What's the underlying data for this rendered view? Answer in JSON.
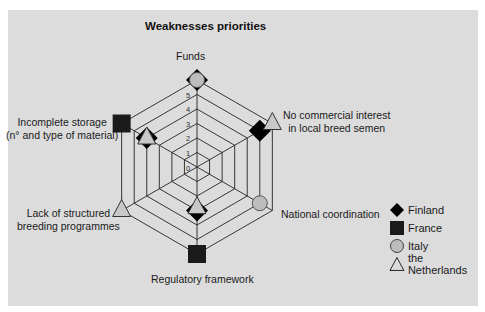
{
  "chart_data": {
    "type": "radar",
    "title": "Weaknesses priorities",
    "axes": [
      "Funds",
      "No commercial interest in local breed semen",
      "National coordination",
      "Regulatory framework",
      "Lack of structured breeding programmes",
      "Incomplete storage (n° and type of material)"
    ],
    "r_ticks": [
      0,
      1,
      2,
      3,
      4,
      5
    ],
    "r_range": [
      0,
      6
    ],
    "series": [
      {
        "name": "Finland",
        "marker": "diamond",
        "color": "#000000",
        "values": {
          "Funds": 6,
          "No commercial interest in local breed semen": 5,
          "Regulatory framework": 3,
          "Incomplete storage (n° and type of material)": 4
        }
      },
      {
        "name": "France",
        "marker": "square",
        "color": "#1a1a1a",
        "values": {
          "Regulatory framework": 6,
          "Incomplete storage (n° and type of material)": 6
        }
      },
      {
        "name": "Italy",
        "marker": "circle",
        "color": "#bdbdbd",
        "values": {
          "Funds": 6,
          "National coordination": 5
        }
      },
      {
        "name": "the Netherlands",
        "marker": "triangle",
        "color": "#c8c8c8",
        "values": {
          "No commercial interest in local breed semen": 6,
          "Regulatory framework": 2.8,
          "Lack of structured breeding programmes": 6,
          "Incomplete storage (n° and type of material)": 4
        }
      }
    ],
    "legend_position": "right"
  },
  "labels": {
    "title": "Weaknesses priorities",
    "funds": "Funds",
    "no_commercial_1": "No commercial interest",
    "no_commercial_2": "in local breed semen",
    "national": "National coordination",
    "regulatory": "Regulatory framework",
    "lack_1": "Lack of structured",
    "lack_2": "breeding programmes",
    "storage_1": "Incomplete storage",
    "storage_2": "(n° and type of material)"
  },
  "ticks": [
    "0",
    "1",
    "2",
    "3",
    "4",
    "5"
  ],
  "legend": [
    {
      "label": "Finland",
      "icon": "diamond-icon"
    },
    {
      "label": "France",
      "icon": "square-icon"
    },
    {
      "label": "Italy",
      "icon": "circle-icon"
    },
    {
      "label": "the Netherlands",
      "icon": "triangle-icon"
    }
  ]
}
